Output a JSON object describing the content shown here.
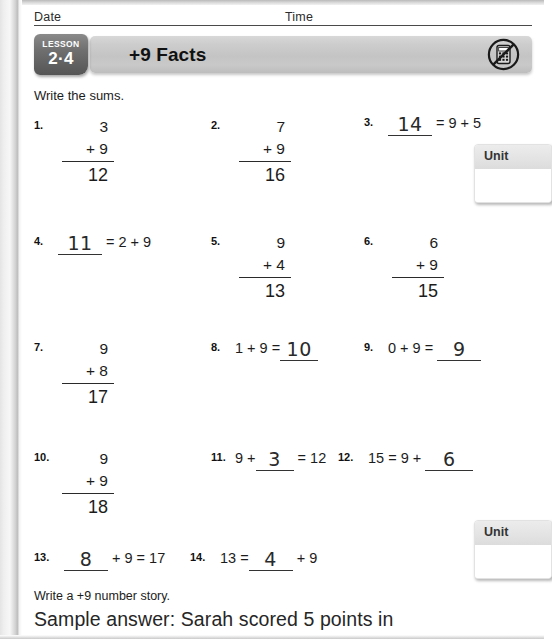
{
  "page": {
    "header": {
      "date_label": "Date",
      "time_label": "Time"
    },
    "banner": {
      "lesson_word": "LESSON",
      "lesson_number": "2·4",
      "title": "+9 Facts",
      "no_calculator_icon": "no-calculator-icon"
    },
    "instructions": {
      "sums": "Write the sums.",
      "story": "Write a +9 number story."
    },
    "sample_answer": "Sample answer: Sarah scored 5 points in",
    "unit_boxes": [
      {
        "label": "Unit",
        "value": ""
      },
      {
        "label": "Unit",
        "value": ""
      }
    ],
    "problems": [
      {
        "num": "1.",
        "format": "vertical",
        "top": "3",
        "bottom": "+ 9",
        "sum": "12"
      },
      {
        "num": "2.",
        "format": "vertical",
        "top": "7",
        "bottom": "+ 9",
        "sum": "16"
      },
      {
        "num": "3.",
        "format": "horizontal",
        "answer": "14",
        "rest": "= 9 + 5",
        "lead": ""
      },
      {
        "num": "4.",
        "format": "horizontal",
        "answer": "11",
        "rest": "= 2 + 9",
        "lead": ""
      },
      {
        "num": "5.",
        "format": "vertical",
        "top": "9",
        "bottom": "+ 4",
        "sum": "13"
      },
      {
        "num": "6.",
        "format": "vertical",
        "top": "6",
        "bottom": "+ 9",
        "sum": "15"
      },
      {
        "num": "7.",
        "format": "vertical",
        "top": "9",
        "bottom": "+ 8",
        "sum": "17"
      },
      {
        "num": "8.",
        "format": "horizontal",
        "lead": "1 + 9 =",
        "answer": "10",
        "rest": ""
      },
      {
        "num": "9.",
        "format": "horizontal",
        "lead": "0 + 9 =",
        "answer": "9",
        "rest": ""
      },
      {
        "num": "10.",
        "format": "vertical",
        "top": "9",
        "bottom": "+ 9",
        "sum": "18"
      },
      {
        "num": "11.",
        "format": "horizontal",
        "lead": "9 +",
        "answer": "3",
        "rest": "= 12"
      },
      {
        "num": "12.",
        "format": "horizontal",
        "lead": "15 = 9 +",
        "answer": "6",
        "rest": ""
      },
      {
        "num": "13.",
        "format": "horizontal",
        "lead": "",
        "answer": "8",
        "rest": "+ 9 = 17"
      },
      {
        "num": "14.",
        "format": "horizontal",
        "lead": "13 =",
        "answer": "4",
        "rest": "+ 9"
      }
    ]
  }
}
